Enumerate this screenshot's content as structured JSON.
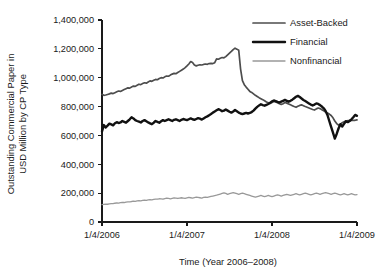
{
  "chart_data": {
    "type": "line",
    "title": "",
    "subtitle": "",
    "xlabel": "Time (Year 2006–2008)",
    "ylabel": "Outstanding Commercial Paper in USD Million by CP Type",
    "ylabel_line1": "Outstanding Commercial Paper in",
    "ylabel_line2": "USD Million by CP Type",
    "ylim": [
      0,
      1400000
    ],
    "xlim": [
      "1/4/2006",
      "1/4/2009"
    ],
    "grid": false,
    "legend_position": "top-right",
    "ytick_labels": [
      "0",
      "200,000",
      "400,000",
      "600,000",
      "800,000",
      "1,000,000",
      "1,200,000",
      "1,400,000"
    ],
    "ytick_values": [
      0,
      200000,
      400000,
      600000,
      800000,
      1000000,
      1200000,
      1400000
    ],
    "xtick_labels": [
      "1/4/2006",
      "1/4/2007",
      "1/4/2008",
      "1/4/2009"
    ],
    "xtick_values": [
      0,
      1,
      2,
      3
    ],
    "colors": {
      "asset_backed": "#4d4d4d",
      "financial": "#111111",
      "nonfinancial": "#999999",
      "axis": "#1a1a1a",
      "background": "#ffffff"
    },
    "series": [
      {
        "name": "Asset-Backed",
        "color": "#4d4d4d",
        "stroke_width": 1.7,
        "values": [
          885000,
          878000,
          880000,
          884000,
          888000,
          893000,
          890000,
          896000,
          902000,
          908000,
          905000,
          912000,
          918000,
          924000,
          930000,
          928000,
          936000,
          942000,
          940000,
          948000,
          955000,
          952000,
          960000,
          965000,
          962000,
          970000,
          978000,
          975000,
          982000,
          988000,
          986000,
          994000,
          1000000,
          998000,
          1006000,
          1012000,
          1010000,
          1018000,
          1025000,
          1030000,
          1028000,
          1036000,
          1044000,
          1052000,
          1060000,
          1070000,
          1082000,
          1095000,
          1112000,
          1105000,
          1088000,
          1082000,
          1086000,
          1090000,
          1088000,
          1092000,
          1095000,
          1093000,
          1098000,
          1100000,
          1098000,
          1104000,
          1130000,
          1128000,
          1135000,
          1140000,
          1138000,
          1146000,
          1158000,
          1170000,
          1182000,
          1195000,
          1205000,
          1198000,
          1190000,
          1060000,
          980000,
          952000,
          935000,
          920000,
          905000,
          898000,
          888000,
          878000,
          870000,
          862000,
          855000,
          848000,
          840000,
          832000,
          826000,
          822000,
          828000,
          835000,
          832000,
          826000,
          820000,
          815000,
          820000,
          828000,
          824000,
          818000,
          812000,
          806000,
          800000,
          795000,
          802000,
          808000,
          812000,
          806000,
          800000,
          795000,
          790000,
          785000,
          780000,
          776000,
          784000,
          790000,
          786000,
          778000,
          770000,
          762000,
          756000,
          748000,
          738000,
          722000,
          700000,
          682000,
          672000,
          678000,
          688000,
          695000,
          700000,
          702000,
          705000,
          706000,
          704000,
          705000,
          708000
        ]
      },
      {
        "name": "Financial",
        "color": "#111111",
        "stroke_width": 2.4,
        "values": [
          628000,
          672000,
          655000,
          668000,
          682000,
          676000,
          670000,
          684000,
          692000,
          686000,
          690000,
          700000,
          694000,
          688000,
          700000,
          712000,
          726000,
          718000,
          706000,
          700000,
          695000,
          690000,
          700000,
          706000,
          698000,
          690000,
          684000,
          678000,
          688000,
          700000,
          694000,
          688000,
          698000,
          706000,
          700000,
          706000,
          712000,
          706000,
          700000,
          708000,
          712000,
          706000,
          700000,
          708000,
          714000,
          710000,
          706000,
          712000,
          718000,
          712000,
          708000,
          714000,
          720000,
          716000,
          710000,
          718000,
          726000,
          732000,
          740000,
          748000,
          758000,
          766000,
          774000,
          782000,
          776000,
          768000,
          772000,
          780000,
          772000,
          764000,
          758000,
          766000,
          776000,
          768000,
          758000,
          752000,
          748000,
          752000,
          756000,
          752000,
          756000,
          762000,
          772000,
          786000,
          798000,
          808000,
          816000,
          810000,
          806000,
          812000,
          818000,
          826000,
          836000,
          842000,
          838000,
          832000,
          828000,
          834000,
          840000,
          846000,
          840000,
          834000,
          840000,
          848000,
          858000,
          868000,
          874000,
          866000,
          856000,
          846000,
          838000,
          830000,
          822000,
          814000,
          808000,
          814000,
          822000,
          818000,
          810000,
          800000,
          788000,
          770000,
          742000,
          700000,
          660000,
          620000,
          578000,
          610000,
          648000,
          678000,
          662000,
          680000,
          698000,
          692000,
          700000,
          712000,
          726000,
          742000,
          736000
        ]
      },
      {
        "name": "Nonfinancial",
        "color": "#999999",
        "stroke_width": 1.3,
        "values": [
          120000,
          122000,
          124000,
          123000,
          126000,
          128000,
          127000,
          130000,
          132000,
          131000,
          134000,
          136000,
          135000,
          138000,
          140000,
          139000,
          142000,
          144000,
          143000,
          146000,
          148000,
          147000,
          150000,
          152000,
          150000,
          153000,
          155000,
          154000,
          157000,
          159000,
          158000,
          161000,
          160000,
          158000,
          162000,
          165000,
          163000,
          161000,
          164000,
          167000,
          165000,
          163000,
          166000,
          168000,
          166000,
          164000,
          167000,
          170000,
          168000,
          166000,
          169000,
          172000,
          170000,
          168000,
          166000,
          170000,
          173000,
          171000,
          174000,
          177000,
          180000,
          183000,
          186000,
          190000,
          194000,
          198000,
          202000,
          198000,
          192000,
          196000,
          200000,
          204000,
          200000,
          196000,
          192000,
          196000,
          200000,
          196000,
          192000,
          188000,
          184000,
          180000,
          176000,
          172000,
          176000,
          180000,
          184000,
          180000,
          176000,
          180000,
          184000,
          180000,
          176000,
          180000,
          184000,
          188000,
          184000,
          180000,
          184000,
          188000,
          192000,
          188000,
          184000,
          188000,
          192000,
          196000,
          192000,
          188000,
          192000,
          196000,
          200000,
          196000,
          192000,
          188000,
          192000,
          196000,
          200000,
          196000,
          192000,
          196000,
          200000,
          204000,
          200000,
          196000,
          192000,
          196000,
          200000,
          196000,
          192000,
          188000,
          192000,
          196000,
          192000,
          188000,
          192000,
          196000,
          192000,
          188000,
          190000
        ]
      }
    ]
  },
  "legend": {
    "items": [
      {
        "label": "Asset-Backed"
      },
      {
        "label": "Financial"
      },
      {
        "label": "Nonfinancial"
      }
    ]
  }
}
